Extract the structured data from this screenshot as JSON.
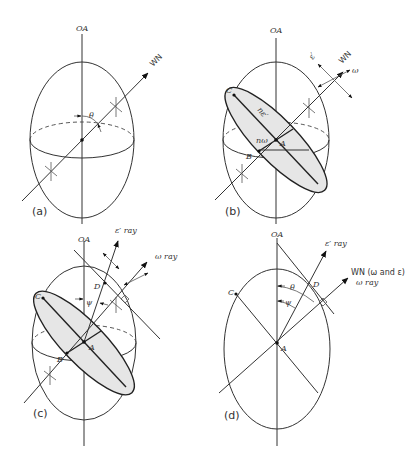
{
  "diagram": {
    "panels": [
      {
        "id": "a",
        "label": "(a)",
        "axis_label": "OA",
        "wave_normal_label": "WN",
        "angle_label": "θ"
      },
      {
        "id": "b",
        "label": "(b)",
        "axis_label": "OA",
        "wave_normal_label": "WN",
        "vibration_labels": [
          "ε′",
          "ω"
        ],
        "point_labels": [
          "C",
          "B",
          "A"
        ],
        "index_labels": [
          "nε′",
          "nω"
        ]
      },
      {
        "id": "c",
        "label": "(c)",
        "axis_label": "OA",
        "ray_labels": [
          "ε′ ray",
          "ω ray"
        ],
        "point_labels": [
          "C",
          "D",
          "A",
          "B"
        ],
        "angle_label": "ψ"
      },
      {
        "id": "d",
        "label": "(d)",
        "axis_label": "OA",
        "ray_labels": [
          "ε′ ray",
          "WN (ω and ε)",
          "ω ray"
        ],
        "point_labels": [
          "C",
          "D",
          "A"
        ],
        "angle_labels": [
          "θ",
          "ψ"
        ]
      }
    ]
  }
}
